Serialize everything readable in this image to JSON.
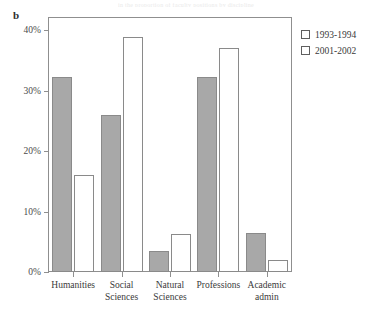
{
  "panel": {
    "label": "b"
  },
  "header_artifact": {
    "text": "in the proportion of faculty positions by discipline"
  },
  "legend": {
    "position": "top-right",
    "entries": [
      {
        "label": "1993-1994",
        "color": "#a8a8a8",
        "swatch": "filled-gray-swatch"
      },
      {
        "label": "2001-2002",
        "color": "#ffffff",
        "swatch": "open-white-swatch"
      }
    ]
  },
  "axes": {
    "y_ticks": [
      "0%",
      "10%",
      "20%",
      "30%",
      "40%"
    ],
    "y_tick_values": [
      0,
      10,
      20,
      30,
      40
    ]
  },
  "chart_data": {
    "type": "bar",
    "title": "",
    "subtitle": "",
    "xlabel": "",
    "ylabel": "",
    "ylim": [
      0,
      42
    ],
    "ytick_values": [
      0,
      10,
      20,
      30,
      40
    ],
    "ytick_labels": [
      "0%",
      "10%",
      "20%",
      "30%",
      "40%"
    ],
    "grid": false,
    "legend_position": "top-right",
    "categories": [
      "Humanities",
      "Social\nSciences",
      "Natural\nSciences",
      "Professions",
      "Academic\nadmin"
    ],
    "series": [
      {
        "name": "1993-1994",
        "color": "#a8a8a8",
        "values": [
          32.2,
          25.9,
          3.5,
          32.2,
          6.5
        ]
      },
      {
        "name": "2001-2002",
        "color": "#ffffff",
        "values": [
          16.1,
          38.9,
          6.3,
          37.0,
          2.0
        ]
      }
    ]
  }
}
